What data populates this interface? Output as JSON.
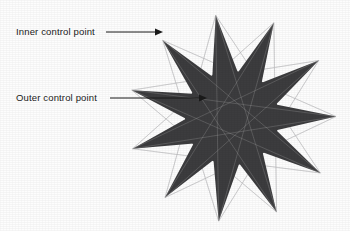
{
  "figure": {
    "background_color": "#fdfdfd",
    "fill_color": "#3c3c3e",
    "chord_color": "#b9b9bb",
    "annotation_color": "#1a1a1a",
    "star": {
      "points": 11,
      "center_x": 232,
      "center_y": 118,
      "outer_radius": 104,
      "inner_radius": 46,
      "rotation_deg": -99,
      "hub_radius": 47,
      "description": "Eleven-point star polygon with dark filled spikes and a solid circular hub, overlaid with thin light construction chords connecting alternating vertices."
    },
    "annotations": [
      {
        "id": "inner-control-point",
        "label": "Inner control point",
        "label_x": 16,
        "label_y": 27,
        "line_from_x": 106,
        "line_from_y": 32,
        "line_to_x": 160,
        "line_to_y": 32,
        "arrow_tip_x": 163,
        "arrow_tip_y": 32
      },
      {
        "id": "outer-control-point",
        "label": "Outer control point",
        "label_x": 16,
        "label_y": 93,
        "line_from_x": 110,
        "line_from_y": 98,
        "line_to_x": 203,
        "line_to_y": 98,
        "arrow_tip_x": 207,
        "arrow_tip_y": 98
      }
    ]
  }
}
